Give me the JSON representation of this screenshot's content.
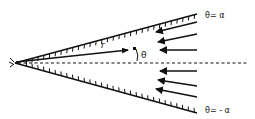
{
  "diagram": {
    "type": "wedge-flow",
    "labels": {
      "upper_wall": "θ= α",
      "lower_wall": "θ= - α",
      "radius": "r",
      "angle": "θ"
    },
    "colors": {
      "ink": "#111111",
      "background": "#ffffff"
    },
    "geometry": {
      "vertex": [
        15,
        63
      ],
      "upper_wall_end": [
        197,
        14
      ],
      "lower_wall_end": [
        197,
        113
      ],
      "centerline_end": [
        247,
        63
      ],
      "radius_vector_end": [
        128,
        50
      ]
    },
    "flow_arrows": [
      {
        "from": [
          197,
          22
        ],
        "to": [
          156,
          32
        ]
      },
      {
        "from": [
          197,
          34
        ],
        "to": [
          158,
          42
        ]
      },
      {
        "from": [
          197,
          50
        ],
        "to": [
          160,
          50
        ]
      },
      {
        "from": [
          197,
          71
        ],
        "to": [
          160,
          71
        ]
      },
      {
        "from": [
          197,
          86
        ],
        "to": [
          158,
          80
        ]
      },
      {
        "from": [
          197,
          97
        ],
        "to": [
          156,
          89
        ]
      }
    ]
  }
}
